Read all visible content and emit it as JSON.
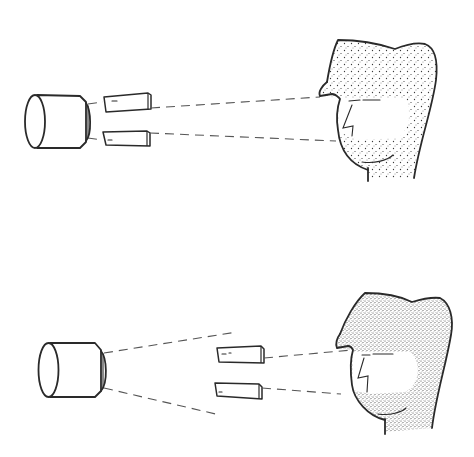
{
  "figure": {
    "colors": {
      "ink": "#2a2a2a",
      "beam": "#555555",
      "stipple": "#3a3a3a",
      "background": "#ffffff"
    },
    "panels": [
      {
        "id": "top",
        "elements": [
          "camera",
          "upper-block",
          "lower-block",
          "beam-upper",
          "beam-lower",
          "stippled-head"
        ],
        "stipple_density": "light"
      },
      {
        "id": "bottom",
        "elements": [
          "camera",
          "diverging-beam-upper",
          "diverging-beam-lower",
          "upper-block",
          "lower-block",
          "beam-upper",
          "beam-lower",
          "stippled-head"
        ],
        "stipple_density": "dense"
      }
    ]
  }
}
